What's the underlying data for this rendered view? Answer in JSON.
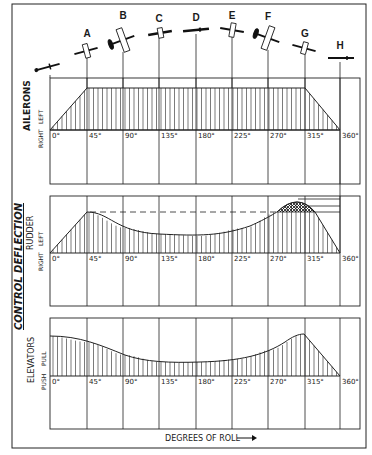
{
  "title": "CONTROL DEFLECTION",
  "xlabel": "DEGREES OF ROLL",
  "positions": [
    "A",
    "B",
    "C",
    "D",
    "E",
    "F",
    "G",
    "H"
  ],
  "ticks": [
    "0°",
    "45°",
    "90°",
    "135°",
    "180°",
    "225°",
    "270°",
    "315°",
    "360°"
  ],
  "panels": [
    {
      "name": "AILERONS",
      "pos_label": "LEFT",
      "neg_label": "RIGHT"
    },
    {
      "name": "RUDDER",
      "pos_label": "LEFT",
      "neg_label": "RIGHT"
    },
    {
      "name": "ELEVATORS",
      "pos_label": "PULL",
      "neg_label": "PUSH"
    }
  ],
  "chart_data": [
    {
      "type": "area",
      "title": "AILERONS",
      "xlabel": "DEGREES OF ROLL",
      "ylabel": "LEFT / RIGHT",
      "x": [
        0,
        45,
        90,
        135,
        180,
        225,
        270,
        315,
        360
      ],
      "values": [
        0,
        1,
        1,
        1,
        1,
        1,
        1,
        1,
        0
      ],
      "note": "Trapezoid: full left aileron from 45° to 315°, ramps at ends"
    },
    {
      "type": "area",
      "title": "RUDDER",
      "xlabel": "DEGREES OF ROLL",
      "ylabel": "LEFT / RIGHT",
      "x": [
        0,
        45,
        90,
        135,
        180,
        225,
        270,
        300,
        315,
        360
      ],
      "values": [
        0,
        1.0,
        0.75,
        0.6,
        0.58,
        0.62,
        0.9,
        1.3,
        1.0,
        0
      ],
      "note": "Peak near 300° exceeds 45° level (cross-hatched), dashed reference at 45° level"
    },
    {
      "type": "area",
      "title": "ELEVATORS",
      "xlabel": "DEGREES OF ROLL",
      "ylabel": "PULL / PUSH",
      "x": [
        0,
        45,
        90,
        135,
        180,
        225,
        270,
        300,
        315,
        360
      ],
      "values": [
        1.0,
        0.85,
        0.55,
        0.4,
        0.38,
        0.48,
        0.75,
        1.0,
        0.8,
        0
      ],
      "note": "Start with pull, dip mid-roll, peak near 300°, zero at 360°"
    }
  ]
}
